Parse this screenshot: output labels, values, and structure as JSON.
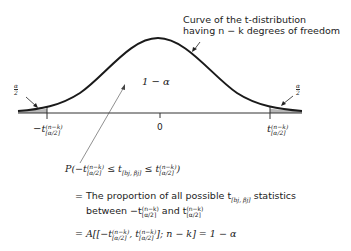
{
  "diagram": {
    "curve_label_line1": "Curve of the t-distribution",
    "curve_label_line2": "having n − k degrees of freedom",
    "center_area_label": "1 − α",
    "left_tail_label": {
      "num": "α",
      "den": "2"
    },
    "right_tail_label": {
      "num": "α",
      "den": "2"
    },
    "axis_center_label": "0",
    "left_cutoff": {
      "prefix": "−t",
      "sup": "(n−k)",
      "sub": "[α/2]"
    },
    "right_cutoff": {
      "prefix": "t",
      "sup": "(n−k)",
      "sub": "[α/2]"
    },
    "colors": {
      "curve": "#1a1a1a",
      "tail_fill": "#b8b8b8",
      "axis": "#333333"
    }
  },
  "equations": {
    "line1": {
      "P": "P(",
      "neg_t": "−t",
      "sup": "(n−k)",
      "sub": "[α/2]",
      "le1": " ≤ t",
      "stat_sub": "[bj, βj]",
      "le2": " ≤ t",
      "close": ")"
    },
    "line2_a": "= The proportion of all possible t",
    "line2_sub": "[bj, βj]",
    "line2_b": " statistics",
    "line3_a": "between −t",
    "line3_mid": " and t",
    "line4_a": "= A[[−t",
    "line4_comma": ", t",
    "line4_b": "]; n − k] = 1 − α"
  }
}
